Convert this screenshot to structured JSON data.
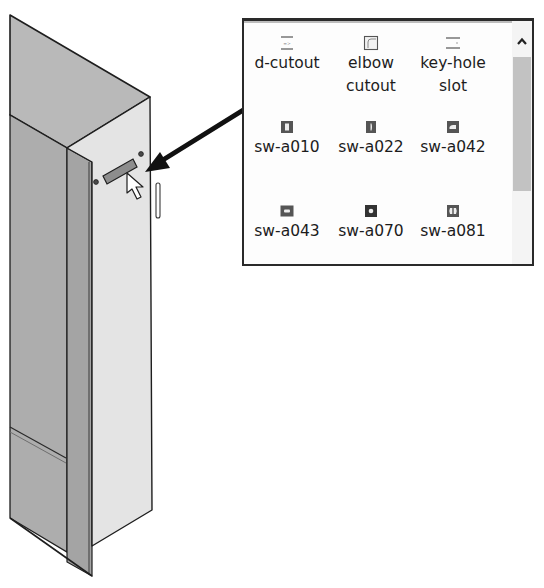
{
  "design_library": {
    "items": [
      {
        "label": "d-cutout",
        "icon": "d-cutout-icon"
      },
      {
        "label": "elbow\ncutout",
        "icon": "elbow-cutout-icon"
      },
      {
        "label": "key-hole\nslot",
        "icon": "key-hole-slot-icon"
      },
      {
        "label": "sw-a010",
        "icon": "rect-slot-tall-icon"
      },
      {
        "label": "sw-a022",
        "icon": "narrow-slot-icon"
      },
      {
        "label": "sw-a042",
        "icon": "d-shape-cutout-icon"
      },
      {
        "label": "sw-a043",
        "icon": "rect-slot-wide-icon"
      },
      {
        "label": "sw-a070",
        "icon": "round-hole-icon"
      },
      {
        "label": "sw-a081",
        "icon": "double-d-cutout-icon"
      }
    ],
    "scrollbar": {
      "up_arrow": "^"
    }
  },
  "model": {
    "description": "sheet metal enclosure corner with d-cutout feature being dragged onto front flange",
    "colors": {
      "top_face": "#b8b8b8",
      "side_face": "#a9a9a9",
      "flange_face": "#e6e6e6",
      "edge": "#1e1e1e",
      "feature": "#8a8a8a"
    }
  },
  "callout_arrow": {
    "from": "d-cutout",
    "to": "cursor drop location"
  }
}
